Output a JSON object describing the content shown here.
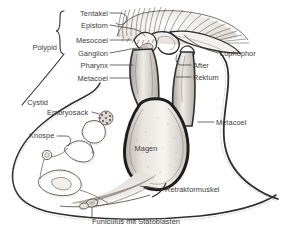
{
  "figure": {
    "background_color": "#ffffff",
    "ink_color": "#2b2b2b",
    "label_color": "#3b3b3b",
    "tissue_fill": "#f2efeb",
    "shade_color": "#cfcac4",
    "width": 283,
    "height": 236
  },
  "labels": {
    "polypid": "Polypid",
    "cystid": "Cystid",
    "tentakel": "Tentakel",
    "epistom": "Epistom",
    "mesocoel": "Mesocoel",
    "ganglion": "Ganglion",
    "pharynx": "Pharynx",
    "metacoel_left": "Metacoel",
    "lophophor": "Lophophor",
    "after": "After",
    "rektum": "Rektum",
    "metacoel_right": "Metacoel",
    "embryosack": "Embryosack",
    "knospe": "Knospe",
    "magen": "Magen",
    "retraktormuskel": "Retraktormuskel",
    "funiculus": "Funiculus mit Statoblasten"
  },
  "label_positions": {
    "polypid": {
      "x": 57,
      "y": 47,
      "align": "right"
    },
    "cystid": {
      "x": 48,
      "y": 102,
      "align": "right"
    },
    "tentakel": {
      "x": 108,
      "y": 14,
      "align": "right"
    },
    "epistom": {
      "x": 108,
      "y": 26,
      "align": "right"
    },
    "mesocoel": {
      "x": 108,
      "y": 41,
      "align": "right"
    },
    "ganglion": {
      "x": 108,
      "y": 54,
      "align": "right"
    },
    "pharynx": {
      "x": 108,
      "y": 66,
      "align": "right"
    },
    "metacoel_left": {
      "x": 108,
      "y": 79,
      "align": "right"
    },
    "lophophor": {
      "x": 220,
      "y": 54,
      "align": "left"
    },
    "after": {
      "x": 193,
      "y": 66,
      "align": "left"
    },
    "rektum": {
      "x": 193,
      "y": 78,
      "align": "left"
    },
    "metacoel_right": {
      "x": 216,
      "y": 123,
      "align": "left"
    },
    "embryosack": {
      "x": 47,
      "y": 113,
      "align": "left"
    },
    "knospe": {
      "x": 29,
      "y": 136,
      "align": "left"
    },
    "magen": {
      "x": 146,
      "y": 148,
      "align": "center"
    },
    "retraktormuskel": {
      "x": 165,
      "y": 190,
      "align": "left"
    },
    "funiculus": {
      "x": 92,
      "y": 222,
      "align": "left"
    }
  },
  "anatomy_parts": [
    "Tentakel",
    "Epistom",
    "Mesocoel",
    "Ganglion",
    "Pharynx",
    "Metacoel",
    "Lophophor",
    "After",
    "Rektum",
    "Magen",
    "Embryosack",
    "Knospe",
    "Retraktormuskel",
    "Funiculus mit Statoblasten",
    "Polypid",
    "Cystid"
  ]
}
